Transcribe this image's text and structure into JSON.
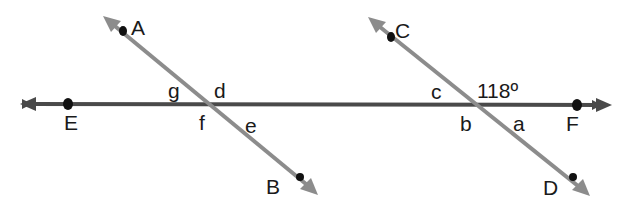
{
  "diagram": {
    "type": "transversals-crossing-line",
    "points": {
      "A": "A",
      "B": "B",
      "C": "C",
      "D": "D",
      "E": "E",
      "F": "F"
    },
    "angles": {
      "a": "a",
      "b": "b",
      "c": "c",
      "d": "d",
      "e": "e",
      "f": "f",
      "g": "g"
    },
    "given_angle": "118º",
    "colors": {
      "main_line": "#4a4a4a",
      "transversal": "#8c8c8c",
      "point": "#111111"
    }
  }
}
